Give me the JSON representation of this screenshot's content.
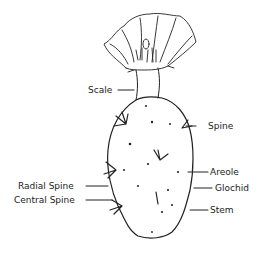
{
  "diagram": {
    "labels": {
      "scale": "Scale",
      "spine": "Spine",
      "areole": "Areole",
      "glochid": "Glochid",
      "radial_spine": "Radial Spine",
      "central_spine": "Central Spine",
      "stem": "Stem"
    },
    "colors": {
      "ink": "#222222",
      "background": "#ffffff"
    }
  }
}
